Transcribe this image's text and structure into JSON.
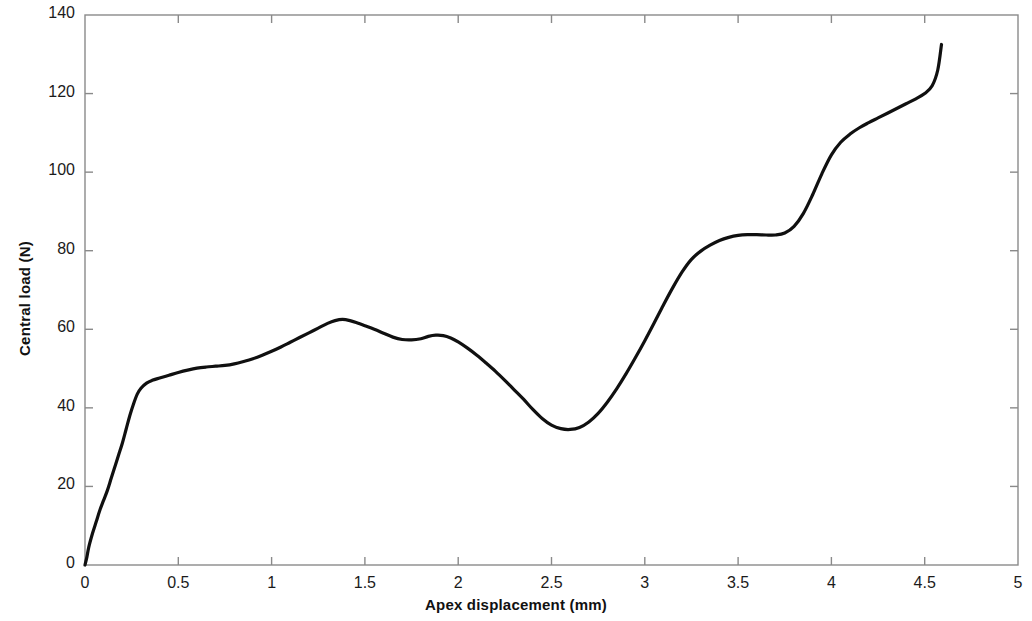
{
  "chart_data": {
    "type": "line",
    "title": "",
    "xlabel": "Apex displacement (mm)",
    "ylabel": "Central load (N)",
    "xlim": [
      0,
      5
    ],
    "ylim": [
      0,
      140
    ],
    "xticks": [
      0,
      0.5,
      1,
      1.5,
      2,
      2.5,
      3,
      3.5,
      4,
      4.5,
      5
    ],
    "xticklabels": [
      "0",
      "0.5",
      "1",
      "1.5",
      "2",
      "2.5",
      "3",
      "3.5",
      "4",
      "4.5",
      "5"
    ],
    "yticks": [
      0,
      20,
      40,
      60,
      80,
      100,
      120,
      140
    ],
    "yticklabels": [
      "0",
      "20",
      "40",
      "60",
      "80",
      "100",
      "120",
      "140"
    ],
    "grid": false,
    "legend": null,
    "line_color": "#101010",
    "line_width": 3.2,
    "series": [
      {
        "name": "Central load",
        "x": [
          0.0,
          0.01,
          0.02,
          0.04,
          0.06,
          0.08,
          0.1,
          0.12,
          0.14,
          0.16,
          0.18,
          0.2,
          0.22,
          0.24,
          0.26,
          0.28,
          0.3,
          0.33,
          0.36,
          0.4,
          0.45,
          0.5,
          0.55,
          0.6,
          0.65,
          0.7,
          0.75,
          0.8,
          0.85,
          0.9,
          0.95,
          1.0,
          1.05,
          1.1,
          1.15,
          1.2,
          1.25,
          1.3,
          1.34,
          1.38,
          1.42,
          1.46,
          1.5,
          1.55,
          1.6,
          1.65,
          1.7,
          1.75,
          1.8,
          1.84,
          1.88,
          1.92,
          1.96,
          2.0,
          2.05,
          2.1,
          2.15,
          2.2,
          2.25,
          2.3,
          2.35,
          2.4,
          2.45,
          2.5,
          2.55,
          2.6,
          2.65,
          2.7,
          2.75,
          2.8,
          2.85,
          2.9,
          2.95,
          3.0,
          3.05,
          3.1,
          3.15,
          3.2,
          3.25,
          3.3,
          3.35,
          3.4,
          3.45,
          3.5,
          3.55,
          3.6,
          3.65,
          3.7,
          3.75,
          3.8,
          3.85,
          3.9,
          3.95,
          4.0,
          4.05,
          4.1,
          4.15,
          4.2,
          4.25,
          4.3,
          4.35,
          4.4,
          4.45,
          4.5,
          4.54,
          4.57,
          4.59
        ],
        "y": [
          0.0,
          2.0,
          4.5,
          8.0,
          11.0,
          14.0,
          16.5,
          19.0,
          22.0,
          25.0,
          28.0,
          31.0,
          34.5,
          38.0,
          41.0,
          43.5,
          45.0,
          46.3,
          47.0,
          47.6,
          48.3,
          49.0,
          49.6,
          50.1,
          50.4,
          50.6,
          50.8,
          51.2,
          51.8,
          52.5,
          53.4,
          54.4,
          55.5,
          56.7,
          57.9,
          59.1,
          60.3,
          61.5,
          62.2,
          62.5,
          62.2,
          61.6,
          60.9,
          60.0,
          59.0,
          58.0,
          57.4,
          57.3,
          57.6,
          58.2,
          58.5,
          58.4,
          57.8,
          56.8,
          55.2,
          53.4,
          51.4,
          49.3,
          47.0,
          44.6,
          42.2,
          39.6,
          37.3,
          35.6,
          34.7,
          34.5,
          35.0,
          36.4,
          38.6,
          41.5,
          44.9,
          48.7,
          52.8,
          57.1,
          61.6,
          66.2,
          70.6,
          74.6,
          77.8,
          79.9,
          81.4,
          82.6,
          83.4,
          83.9,
          84.1,
          84.1,
          84.0,
          84.0,
          84.5,
          86.2,
          89.5,
          94.3,
          99.7,
          104.4,
          107.6,
          109.7,
          111.3,
          112.6,
          113.8,
          115.0,
          116.2,
          117.4,
          118.6,
          120.0,
          122.0,
          126.0,
          132.5
        ]
      }
    ],
    "annotations": {
      "initial_peak_x": 1.36,
      "initial_peak_y": 62.5,
      "valley_x": 2.45,
      "valley_y": 34.5,
      "plateau_x": 3.55,
      "plateau_y": 84.1,
      "final_x": 4.59,
      "final_y": 132.5
    }
  },
  "figure": {
    "background_color": "#ffffff",
    "axis_color": "#808080",
    "tick_color": "#808080",
    "text_color": "#1a1a1a"
  }
}
